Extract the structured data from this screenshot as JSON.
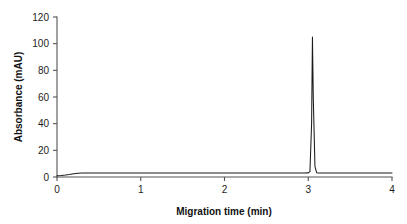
{
  "chart_data": {
    "type": "line",
    "title": "",
    "subtitle": "",
    "xlabel": "Migration time (min)",
    "ylabel": "Absorbance (mAU)",
    "xlim": [
      0,
      4
    ],
    "ylim": [
      0,
      120
    ],
    "xticks": [
      0,
      1,
      2,
      3,
      4
    ],
    "xtick_labels": [
      "0",
      "1",
      "2",
      "3",
      "4"
    ],
    "yticks": [
      0,
      20,
      40,
      60,
      80,
      100,
      120
    ],
    "ytick_labels": [
      "0",
      "20",
      "40",
      "60",
      "80",
      "100",
      "120"
    ],
    "grid": false,
    "legend": false,
    "legend_position": "none",
    "line_color": "#1b1b1b",
    "axis_color": "#545454",
    "background_color": "#ffffff",
    "annotations": [],
    "series": [
      {
        "name": "Absorbance trace",
        "x": [
          0.0,
          0.05,
          0.1,
          0.15,
          0.2,
          0.25,
          0.3,
          0.4,
          0.5,
          0.6,
          0.7,
          0.8,
          0.9,
          1.0,
          1.1,
          1.2,
          1.3,
          1.4,
          1.5,
          1.6,
          1.7,
          1.8,
          1.9,
          2.0,
          2.1,
          2.2,
          2.3,
          2.4,
          2.5,
          2.6,
          2.7,
          2.8,
          2.9,
          2.95,
          3.0,
          3.02,
          3.04,
          3.05,
          3.06,
          3.08,
          3.1,
          3.12,
          3.15,
          3.2,
          3.3,
          3.4,
          3.5,
          3.6,
          3.7,
          3.8,
          3.9,
          4.0
        ],
        "y": [
          1.0,
          1.2,
          1.5,
          1.9,
          2.4,
          2.8,
          3.0,
          3.0,
          3.0,
          3.0,
          3.0,
          3.0,
          3.0,
          3.0,
          3.0,
          3.0,
          3.0,
          3.0,
          3.0,
          3.0,
          3.0,
          3.0,
          3.0,
          3.0,
          3.0,
          3.0,
          3.0,
          3.0,
          3.0,
          3.0,
          3.0,
          3.0,
          3.0,
          3.0,
          3.1,
          4.0,
          40.0,
          105.0,
          60.0,
          8.0,
          3.2,
          3.0,
          3.0,
          3.0,
          3.0,
          3.0,
          3.0,
          3.0,
          3.0,
          3.0,
          3.0,
          3.0
        ]
      }
    ],
    "peak": {
      "migration_time_min": 3.05,
      "height_mau": 105
    },
    "baseline_mau": 3.0
  }
}
